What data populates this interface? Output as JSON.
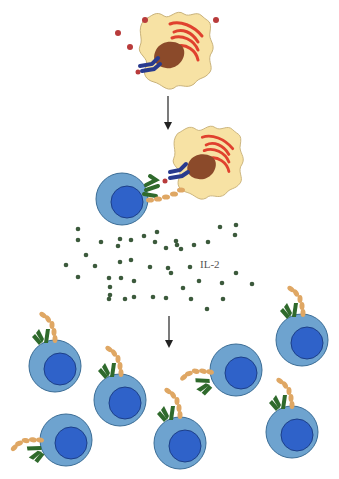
{
  "diagram": {
    "labels": {
      "cytokine": "IL-2"
    },
    "colors": {
      "apc_body": "#f7e2a4",
      "apc_outline": "#c9b27a",
      "apc_nucleus": "#8b4a2a",
      "er": "#e0412e",
      "mhc": "#283a8e",
      "antigen": "#b83b3b",
      "tcell_body": "#6ea3cf",
      "tcell_outline": "#3b6d96",
      "tcell_nucleus": "#2f62c9",
      "tcr": "#2f6a2c",
      "il2_receptor": "#dfa764",
      "il2": "#3c5a3c",
      "arrow": "#222222"
    },
    "stages": [
      {
        "name": "antigen-capture",
        "description": "APC with antigen"
      },
      {
        "name": "activation",
        "description": "T cell binds APC via TCR"
      },
      {
        "name": "il2-secretion",
        "description": "IL-2 released"
      },
      {
        "name": "proliferation",
        "description": "T cell clonal expansion"
      }
    ]
  }
}
